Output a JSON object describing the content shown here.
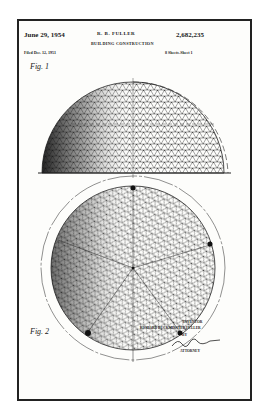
{
  "document": {
    "type": "patent drawing",
    "date": "June 29, 1954",
    "inventor_header": "R. B. FULLER",
    "title": "BUILDING CONSTRUCTION",
    "patent_number": "2,682,235",
    "filed": "Filed Dec. 12, 1951",
    "sheets": "8 Sheets-Sheet 1",
    "figures": [
      {
        "label": "Fig. 1",
        "description": "geodesic dome elevation"
      },
      {
        "label": "Fig. 2",
        "description": "geodesic sphere plan view"
      }
    ],
    "inventor_label": "INVENTOR",
    "inventor_name": "RICHARD BUCKMINSTER FULLER",
    "by_label": "BY",
    "attorney_label": "ATTORNEY"
  }
}
